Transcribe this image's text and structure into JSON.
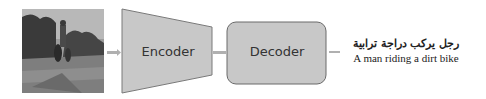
{
  "diagram": {
    "input_image": {
      "description": "grayscale photo of a man riding a dirt bike in a field"
    },
    "encoder": {
      "label": "Encoder",
      "fill": "#c8c8c8",
      "stroke": "#7a7a7a"
    },
    "decoder": {
      "label": "Decoder",
      "fill": "#c8c8c8",
      "stroke": "#6a6a6a"
    },
    "arrows": {
      "color": "#b0b0b0"
    },
    "output": {
      "arabic_caption": "رجل يركب دراجة ترابية",
      "english_caption": "A man riding a dirt bike"
    }
  }
}
